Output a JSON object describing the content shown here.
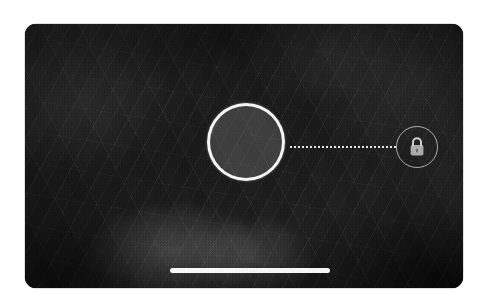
{
  "app": {
    "name": "Camera",
    "mode": "photo",
    "orientation": "landscape",
    "screen_label": "camera-viewfinder"
  },
  "viewfinder": {
    "scene_description": "Dark low-light outdoor scene with grainy rock and branch textures",
    "dominant_color": "#1d1d1d",
    "highlight_color": "#6e6e6e"
  },
  "overlay": {
    "focus_reticle": {
      "label": "Focus and exposure reticle",
      "state": "locked",
      "ring_color": "#ffffff",
      "fill_color": "#4a4a4a",
      "diameter_px": 78,
      "center_x": 221,
      "center_y": 118
    },
    "connector": {
      "label": "Dotted connector line",
      "style": "dotted",
      "color": "#ffffff",
      "length_px": 106
    },
    "lock_button": {
      "label": "AE/AF Lock",
      "icon": "lock-closed-icon",
      "state": "locked",
      "ring_color": "#ffffff",
      "diameter_px": 42,
      "center_x": 392,
      "center_y": 123
    }
  },
  "system": {
    "home_indicator": {
      "label": "Home indicator",
      "color": "#ffffff",
      "width_px": 160,
      "height_px": 5
    }
  }
}
